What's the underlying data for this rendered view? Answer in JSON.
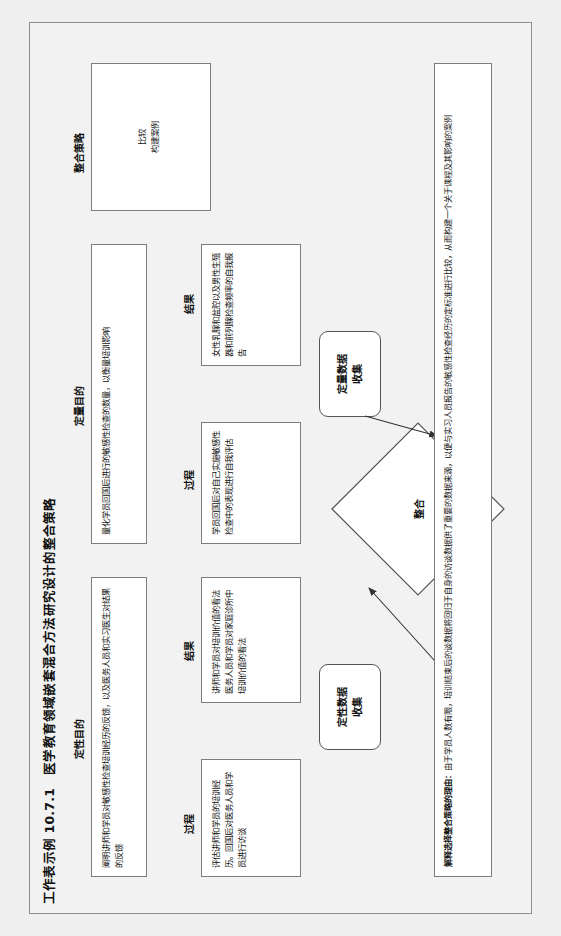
{
  "document": {
    "title": "工作表示例 10.7.1　医学教育领域嵌套混合方法研究设计的整合策略"
  },
  "sections": [
    {
      "key": "qualitative",
      "header": "定性目的"
    },
    {
      "key": "quantitative",
      "header": "定量目的"
    },
    {
      "key": "integration",
      "header": "整合策略"
    }
  ],
  "columns": {
    "process_label": "过程",
    "results_label": "结果"
  },
  "qualitative": {
    "purpose": "阐明讲师和学员对敏感性检查培训经历的反馈，以及医务人员和实习医生对结果的反馈",
    "process": "评估讲师和学员的培训经历。回国后对医务人员和学员进行访谈",
    "results": "讲师和学员对培训价值的看法\n医务人员和学员对家庭诊所中培训价值的看法",
    "collection_node": "定性数据\n收集"
  },
  "quantitative": {
    "purpose": "量化学员回国后进行的敏感性检查的数量，以衡量培训影响",
    "process": "学员回国后对自己实施敏感性检查中的表现进行自我评估",
    "results": "女性乳腺和盆腔以及男性生殖器和前列腺检查频率的自我报告",
    "collection_node": "定量数据\n收集"
  },
  "integration": {
    "diamond_label": "整合",
    "strategies": "比较\n构建案例"
  },
  "footnote": {
    "label": "解释选择整合策略的理由：",
    "text": "由于学员人数有限，培训结束后的谈数据将回归于自身的访谈数据供了重要的数据来源，以便与实习人员报告的敏感性检查经历的定标准进行比较，从而构建一个关于课程及其影响的案例"
  },
  "colors": {
    "page_background": "#efefef",
    "panel_background": "#f2f2f2",
    "box_background": "#ffffff",
    "border": "#7d7d7d",
    "node_border": "#555555",
    "text": "#111111"
  }
}
